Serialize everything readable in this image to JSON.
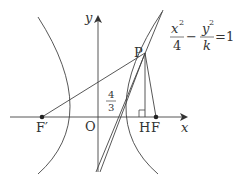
{
  "diagram": {
    "equation": {
      "numerator_left": "x",
      "exp_left": "2",
      "denominator_left": "4",
      "minus": "−",
      "numerator_right": "y",
      "exp_right": "2",
      "denominator_right": "k",
      "equals": "=1"
    },
    "axes": {
      "x_label": "x",
      "y_label": "y",
      "origin_label": "O"
    },
    "points": {
      "P": "P",
      "F": "F",
      "F_prime": "F′",
      "H": "H"
    },
    "slope_label": {
      "numerator": "4",
      "denominator": "3"
    },
    "colors": {
      "line": "#333333",
      "background": "#ffffff"
    }
  }
}
